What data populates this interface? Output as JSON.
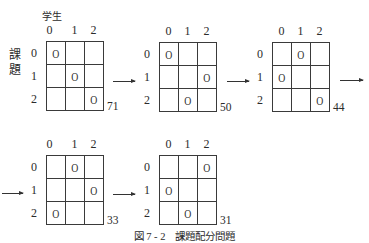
{
  "figure": {
    "column_axis_label": "学生",
    "row_axis_label": [
      "課",
      "題"
    ],
    "caption": "図 7 - 2　課題配分問題",
    "transition_arrow_icon": "right-arrow-icon"
  },
  "steps": [
    {
      "col_labels": [
        "0",
        "1",
        "2"
      ],
      "row_labels": [
        "0",
        "1",
        "2"
      ],
      "grid": [
        [
          "O",
          "",
          ""
        ],
        [
          "",
          "O",
          ""
        ],
        [
          "",
          "",
          "O"
        ]
      ],
      "cost": "71"
    },
    {
      "col_labels": [
        "0",
        "1",
        "2"
      ],
      "row_labels": [
        "0",
        "1",
        "2"
      ],
      "grid": [
        [
          "O",
          "",
          ""
        ],
        [
          "",
          "",
          "O"
        ],
        [
          "",
          "O",
          ""
        ]
      ],
      "cost": "50"
    },
    {
      "col_labels": [
        "0",
        "1",
        "2"
      ],
      "row_labels": [
        "0",
        "1",
        "2"
      ],
      "grid": [
        [
          "",
          "O",
          ""
        ],
        [
          "O",
          "",
          ""
        ],
        [
          "",
          "",
          "O"
        ]
      ],
      "cost": "44"
    },
    {
      "col_labels": [
        "0",
        "1",
        "2"
      ],
      "row_labels": [
        "0",
        "1",
        "2"
      ],
      "grid": [
        [
          "",
          "O",
          ""
        ],
        [
          "",
          "",
          "O"
        ],
        [
          "O",
          "",
          ""
        ]
      ],
      "cost": "33"
    },
    {
      "col_labels": [
        "0",
        "1",
        "2"
      ],
      "row_labels": [
        "0",
        "1",
        "2"
      ],
      "grid": [
        [
          "",
          "",
          "O"
        ],
        [
          "O",
          "",
          ""
        ],
        [
          "",
          "O",
          ""
        ]
      ],
      "cost": "31"
    }
  ]
}
